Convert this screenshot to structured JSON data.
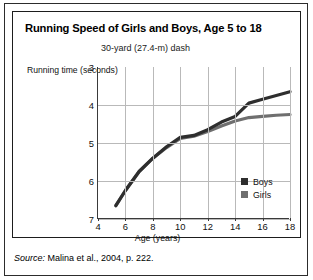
{
  "figure": {
    "title": "Running Speed of Girls and Boys, Age 5 to 18",
    "subtitle": "30-yard (27.4-m) dash",
    "source_label": "Source:",
    "source_text": " Malina et al., 2004, p. 222."
  },
  "colors": {
    "boys": "#2e2e2e",
    "girls": "#6f6f6f",
    "grid": "#b9b9b9",
    "axis": "#3a3a3a",
    "frame": "#1d1d1d",
    "text": "#111111"
  },
  "legend": {
    "position": "inside-bottom-right",
    "entries": [
      {
        "label": "Boys",
        "color": "#2e2e2e"
      },
      {
        "label": "Girls",
        "color": "#6f6f6f"
      }
    ]
  },
  "chart_data": {
    "type": "line",
    "title": "Running Speed of Girls and Boys, Age 5 to 18",
    "subtitle": "30-yard (27.4-m) dash",
    "xlabel": "Age (years)",
    "ylabel": "Running time (seconds)",
    "xlim": [
      4,
      18
    ],
    "ylim": [
      3,
      7
    ],
    "y_axis_inverted": true,
    "xticks": [
      4,
      6,
      8,
      10,
      12,
      14,
      16,
      18
    ],
    "yticks": [
      3,
      4,
      5,
      6,
      7
    ],
    "grid": true,
    "series": [
      {
        "name": "Boys",
        "color": "#2e2e2e",
        "x": [
          5.3,
          6,
          7,
          8,
          9,
          10,
          11,
          12,
          13,
          14,
          15,
          16,
          17,
          18
        ],
        "values": [
          6.65,
          6.25,
          5.75,
          5.4,
          5.1,
          4.85,
          4.8,
          4.65,
          4.45,
          4.3,
          3.95,
          3.85,
          3.75,
          3.65
        ]
      },
      {
        "name": "Girls",
        "color": "#6f6f6f",
        "x": [
          5.3,
          6,
          7,
          8,
          9,
          10,
          11,
          12,
          13,
          14,
          15,
          16,
          17,
          18
        ],
        "values": [
          6.65,
          6.25,
          5.75,
          5.4,
          5.12,
          4.88,
          4.82,
          4.7,
          4.55,
          4.42,
          4.33,
          4.3,
          4.27,
          4.25
        ]
      }
    ]
  }
}
